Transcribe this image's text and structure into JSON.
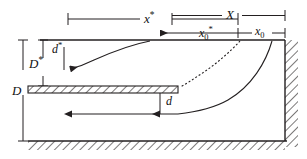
{
  "figure": {
    "type": "technical-diagram",
    "background_color": "#ffffff",
    "line_color": "#231f20",
    "hatch_color": "#231f20"
  },
  "labels": {
    "x_star": {
      "base": "x",
      "sup": "*",
      "name": "x-star"
    },
    "X": {
      "base": "X",
      "sup": "",
      "name": "X"
    },
    "x0_star": {
      "base": "x",
      "sub": "0",
      "sup": "*",
      "name": "x0-star"
    },
    "x0": {
      "base": "x",
      "sub": "0",
      "sup": "",
      "name": "x0"
    },
    "D_star": {
      "base": "D",
      "sup": "*",
      "name": "D-star"
    },
    "D": {
      "base": "D",
      "sup": "",
      "name": "D"
    },
    "d_star": {
      "base": "d",
      "sup": "*",
      "name": "d-star"
    },
    "d": {
      "base": "d",
      "sup": "",
      "name": "d"
    }
  },
  "geometry": {
    "top_wall_y": 40,
    "plate_top_y": 86,
    "plate_bottom_y": 93,
    "plate_left_x": 28,
    "plate_right_x": 178,
    "bottom_wall_y": 141,
    "right_wall_x": 285,
    "left_open_x": 28,
    "dim_line_1_y": 19,
    "dim_line_2_y": 33,
    "vertical_dim_D_x": 23,
    "vertical_dim_Dstar_x": 43
  },
  "elements": {
    "top_wall": "upper horizontal boundary",
    "splitter_plate": "hatched horizontal plate",
    "right_wall": "hatched vertical wall",
    "bottom_wall": "hatched horizontal wall",
    "streamline_upper": "solid curve in upper channel",
    "streamline_dashed": "dashed dividing streamline",
    "streamline_lower": "solid curve into lower channel",
    "arrow_lower_flow": "leftward flow arrow in lower channel"
  }
}
